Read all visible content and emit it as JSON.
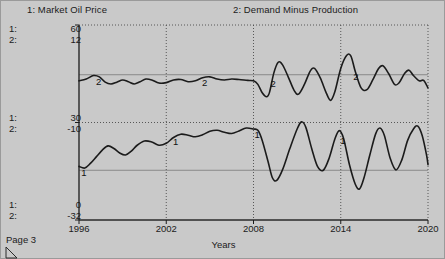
{
  "page": {
    "footer_label": "Page 3",
    "background_color": "#c9c9c9",
    "line_color": "#1b1b1b"
  },
  "titles": {
    "series1": "1: Market Oil Price",
    "series2": "2: Demand Minus Production"
  },
  "axis_scales": {
    "top": {
      "key1": "1:",
      "key2": "2:",
      "value1": "60",
      "value2": "12"
    },
    "middle": {
      "key1": "1:",
      "key2": "2:",
      "value1": "30",
      "value2": "-10"
    },
    "bottom": {
      "key1": "1:",
      "key2": "2:",
      "value1": "0",
      "value2": "-32"
    }
  },
  "chart_data": {
    "type": "line",
    "title": "",
    "xlabel": "Years",
    "grid": true,
    "legend_position": "top",
    "x": [
      1996,
      2002,
      2008,
      2014,
      2020
    ],
    "xlim": [
      1996,
      2020
    ],
    "xtick_labels": [
      "1996",
      "2002",
      "2008",
      "2014",
      "2020"
    ],
    "axes": [
      {
        "id": "y1",
        "name": "Market Oil Price",
        "ylim": [
          0,
          60
        ],
        "ticks": [
          0,
          30,
          60
        ],
        "series_marker": "1"
      },
      {
        "id": "y2",
        "name": "Demand Minus Production",
        "ylim": [
          -32,
          12
        ],
        "ticks": [
          -32,
          -10,
          12
        ],
        "series_marker": "2"
      }
    ],
    "series": [
      {
        "name": "Market Oil Price",
        "marker": "1",
        "axis": "y1",
        "marker_annotations": [
          {
            "label": "1",
            "x": 1996.3
          },
          {
            "label": "1",
            "x": 2002.6
          },
          {
            "label": "1",
            "x": 2008.2
          },
          {
            "label": "1",
            "x": 2014.1
          }
        ],
        "points": [
          [
            1996.0,
            16.5
          ],
          [
            1996.4,
            16.0
          ],
          [
            1996.8,
            17.5
          ],
          [
            1997.2,
            19.5
          ],
          [
            1997.6,
            21.5
          ],
          [
            1998.0,
            22.8
          ],
          [
            1998.4,
            22.0
          ],
          [
            1998.8,
            20.6
          ],
          [
            1999.2,
            20.0
          ],
          [
            1999.6,
            21.2
          ],
          [
            2000.0,
            23.0
          ],
          [
            2000.5,
            24.3
          ],
          [
            2001.0,
            24.0
          ],
          [
            2001.5,
            23.0
          ],
          [
            2002.0,
            23.6
          ],
          [
            2002.5,
            25.4
          ],
          [
            2003.0,
            26.4
          ],
          [
            2003.5,
            26.1
          ],
          [
            2004.0,
            25.6
          ],
          [
            2004.5,
            26.2
          ],
          [
            2005.0,
            27.3
          ],
          [
            2005.5,
            27.6
          ],
          [
            2006.0,
            27.0
          ],
          [
            2006.5,
            26.6
          ],
          [
            2007.0,
            27.4
          ],
          [
            2007.5,
            28.3
          ],
          [
            2008.0,
            28.0
          ],
          [
            2008.3,
            27.6
          ],
          [
            2008.6,
            24.5
          ],
          [
            2009.0,
            18.0
          ],
          [
            2009.3,
            13.0
          ],
          [
            2009.6,
            12.2
          ],
          [
            2010.0,
            15.5
          ],
          [
            2010.5,
            22.0
          ],
          [
            2011.0,
            28.0
          ],
          [
            2011.3,
            30.2
          ],
          [
            2011.6,
            28.5
          ],
          [
            2012.0,
            22.0
          ],
          [
            2012.4,
            16.5
          ],
          [
            2012.8,
            15.3
          ],
          [
            2013.2,
            19.0
          ],
          [
            2013.6,
            25.0
          ],
          [
            2013.9,
            27.5
          ],
          [
            2014.2,
            25.0
          ],
          [
            2014.6,
            17.0
          ],
          [
            2015.0,
            11.0
          ],
          [
            2015.3,
            9.6
          ],
          [
            2015.6,
            13.0
          ],
          [
            2016.0,
            20.0
          ],
          [
            2016.4,
            26.5
          ],
          [
            2016.7,
            28.3
          ],
          [
            2017.0,
            26.0
          ],
          [
            2017.4,
            19.0
          ],
          [
            2017.8,
            15.4
          ],
          [
            2018.2,
            18.5
          ],
          [
            2018.6,
            24.5
          ],
          [
            2019.0,
            28.0
          ],
          [
            2019.3,
            28.9
          ],
          [
            2019.6,
            26.0
          ],
          [
            2019.9,
            20.0
          ],
          [
            2020.0,
            17.0
          ]
        ]
      },
      {
        "name": "Demand Minus Production",
        "marker": "2",
        "axis": "y2",
        "marker_annotations": [
          {
            "label": "2",
            "x": 1997.3
          },
          {
            "label": "2",
            "x": 2004.6
          },
          {
            "label": "2",
            "x": 2009.3
          },
          {
            "label": "2",
            "x": 2015.0
          }
        ],
        "points": [
          [
            1996.0,
            -0.6
          ],
          [
            1996.5,
            -0.2
          ],
          [
            1997.0,
            0.6
          ],
          [
            1997.4,
            0.3
          ],
          [
            1997.8,
            -0.9
          ],
          [
            1998.2,
            -1.3
          ],
          [
            1998.6,
            -0.9
          ],
          [
            1999.0,
            -0.4
          ],
          [
            1999.4,
            -0.8
          ],
          [
            1999.8,
            -1.3
          ],
          [
            2000.2,
            -0.8
          ],
          [
            2000.6,
            -0.2
          ],
          [
            2001.0,
            -0.4
          ],
          [
            2001.5,
            -1.1
          ],
          [
            2002.0,
            -1.0
          ],
          [
            2002.5,
            -0.4
          ],
          [
            2003.0,
            -0.3
          ],
          [
            2003.5,
            -0.8
          ],
          [
            2004.0,
            -0.6
          ],
          [
            2004.5,
            0.1
          ],
          [
            2005.0,
            0.3
          ],
          [
            2005.5,
            -0.2
          ],
          [
            2006.0,
            -0.4
          ],
          [
            2006.5,
            -0.2
          ],
          [
            2007.0,
            -0.3
          ],
          [
            2007.6,
            -0.5
          ],
          [
            2008.0,
            -0.6
          ],
          [
            2008.3,
            -1.4
          ],
          [
            2008.6,
            -3.3
          ],
          [
            2008.9,
            -4.2
          ],
          [
            2009.1,
            -3.2
          ],
          [
            2009.4,
            1.2
          ],
          [
            2009.7,
            3.6
          ],
          [
            2010.0,
            3.0
          ],
          [
            2010.4,
            0.2
          ],
          [
            2010.8,
            -2.8
          ],
          [
            2011.1,
            -3.6
          ],
          [
            2011.5,
            -1.4
          ],
          [
            2011.9,
            1.6
          ],
          [
            2012.2,
            2.2
          ],
          [
            2012.6,
            0.0
          ],
          [
            2013.0,
            -3.3
          ],
          [
            2013.3,
            -5.0
          ],
          [
            2013.6,
            -3.0
          ],
          [
            2014.0,
            2.2
          ],
          [
            2014.4,
            5.1
          ],
          [
            2014.7,
            5.0
          ],
          [
            2015.0,
            1.5
          ],
          [
            2015.4,
            -2.2
          ],
          [
            2015.8,
            -2.6
          ],
          [
            2016.2,
            -0.4
          ],
          [
            2016.6,
            2.2
          ],
          [
            2016.9,
            2.8
          ],
          [
            2017.3,
            1.0
          ],
          [
            2017.7,
            -1.4
          ],
          [
            2018.0,
            -1.1
          ],
          [
            2018.4,
            1.1
          ],
          [
            2018.7,
            1.8
          ],
          [
            2019.0,
            0.6
          ],
          [
            2019.4,
            -0.6
          ],
          [
            2019.7,
            -0.5
          ],
          [
            2020.0,
            -2.2
          ]
        ]
      }
    ]
  }
}
